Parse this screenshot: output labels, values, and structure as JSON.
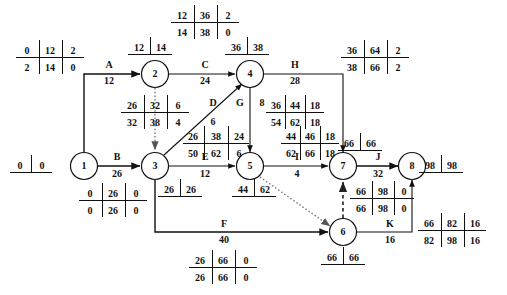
{
  "diagram": {
    "type": "pert-cpm-activity-on-arrow-network",
    "title": "",
    "nodes": [
      {
        "id": "1",
        "label": "1",
        "x": 84,
        "y": 166
      },
      {
        "id": "2",
        "label": "2",
        "x": 155,
        "y": 74
      },
      {
        "id": "3",
        "label": "3",
        "x": 155,
        "y": 166
      },
      {
        "id": "4",
        "label": "4",
        "x": 250,
        "y": 74
      },
      {
        "id": "5",
        "label": "5",
        "x": 250,
        "y": 166
      },
      {
        "id": "6",
        "label": "6",
        "x": 343,
        "y": 232
      },
      {
        "id": "7",
        "label": "7",
        "x": 343,
        "y": 166
      },
      {
        "id": "8",
        "label": "8",
        "x": 412,
        "y": 166
      }
    ],
    "activities": [
      {
        "id": "A",
        "letter": "A",
        "duration": "12",
        "from": "1",
        "to": "2",
        "letter_x": 109,
        "letter_y": 68,
        "dur_x": 109,
        "dur_y": 84
      },
      {
        "id": "B",
        "letter": "B",
        "duration": "26",
        "from": "1",
        "to": "3",
        "letter_x": 117,
        "letter_y": 160,
        "dur_x": 117,
        "dur_y": 176
      },
      {
        "id": "C",
        "letter": "C",
        "duration": "24",
        "from": "2",
        "to": "4",
        "letter_x": 205,
        "letter_y": 68,
        "dur_x": 205,
        "dur_y": 84
      },
      {
        "id": "D",
        "letter": "D",
        "duration": "6",
        "from": "3",
        "to": "4",
        "letter_x": 213,
        "letter_y": 105,
        "dur_x": 213,
        "dur_y": 121
      },
      {
        "id": "E",
        "letter": "E",
        "duration": "12",
        "from": "3",
        "to": "5",
        "letter_x": 205,
        "letter_y": 160,
        "dur_x": 205,
        "dur_y": 176
      },
      {
        "id": "F",
        "letter": "F",
        "duration": "40",
        "from": "3",
        "to": "6",
        "letter_x": 224,
        "letter_y": 226,
        "dur_x": 224,
        "dur_y": 242
      },
      {
        "id": "G",
        "letter": "G",
        "duration": "8",
        "from": "4",
        "to": "5",
        "letter_x": 243,
        "letter_y": 105,
        "dur_x": 258,
        "dur_y": 105
      },
      {
        "id": "H",
        "letter": "H",
        "duration": "28",
        "from": "4",
        "to": "7",
        "letter_x": 295,
        "letter_y": 68,
        "dur_x": 295,
        "dur_y": 84
      },
      {
        "id": "I",
        "letter": "I",
        "duration": "4",
        "from": "5",
        "to": "7",
        "letter_x": 297,
        "letter_y": 160,
        "dur_x": 297,
        "dur_y": 176
      },
      {
        "id": "J",
        "letter": "J",
        "duration": "32",
        "from": "7",
        "to": "8",
        "letter_x": 378,
        "letter_y": 160,
        "dur_x": 378,
        "dur_y": 176
      },
      {
        "id": "K",
        "letter": "K",
        "duration": "16",
        "from": "6",
        "to": "8",
        "letter_x": 390,
        "letter_y": 226,
        "dur_x": 390,
        "dur_y": 242
      }
    ],
    "dummy_links": [
      {
        "id": "dummy-2-3",
        "from": "2",
        "to": "3",
        "style": "dotted"
      },
      {
        "id": "dummy-5-6",
        "from": "5",
        "to": "6",
        "style": "dotted"
      },
      {
        "id": "dummy-6-7",
        "from": "6",
        "to": "7",
        "style": "dashed"
      }
    ],
    "node_time_boxes": [
      {
        "id": "node-1-times",
        "node": "1",
        "cells": [
          "0",
          "0"
        ],
        "cx": 31,
        "cy": 166
      },
      {
        "id": "node-2-times",
        "node": "2",
        "cells": [
          "12",
          "14"
        ],
        "cx": 149,
        "cy": 48
      },
      {
        "id": "node-3-times",
        "node": "3",
        "cells": [
          "26",
          "26"
        ],
        "cx": 179,
        "cy": 190
      },
      {
        "id": "node-4-times",
        "node": "4",
        "cells": [
          "36",
          "38"
        ],
        "cx": 246,
        "cy": 48
      },
      {
        "id": "node-5-times",
        "node": "5",
        "cells": [
          "44",
          "62"
        ],
        "cx": 253,
        "cy": 190
      },
      {
        "id": "node-6-times",
        "node": "6",
        "cells": [
          "66",
          "66"
        ],
        "cx": 342,
        "cy": 258
      },
      {
        "id": "node-7-times",
        "node": "7",
        "cells": [
          "66",
          "66"
        ],
        "cx": 359,
        "cy": 144
      },
      {
        "id": "node-8-times",
        "node": "8",
        "cells": [
          "98",
          "98"
        ],
        "cx": 440,
        "cy": 166
      }
    ],
    "activity_tables": [
      {
        "id": "table-A",
        "activity": "A",
        "top": [
          "0",
          "12",
          "2"
        ],
        "bottom": [
          "2",
          "14",
          "0"
        ],
        "cx": 50,
        "cy": 57
      },
      {
        "id": "table-C",
        "activity": "C",
        "top": [
          "12",
          "36",
          "2"
        ],
        "bottom": [
          "14",
          "38",
          "0"
        ],
        "cx": 205,
        "cy": 22
      },
      {
        "id": "table-H",
        "activity": "H",
        "top": [
          "36",
          "64",
          "2"
        ],
        "bottom": [
          "38",
          "66",
          "2"
        ],
        "cx": 375,
        "cy": 57
      },
      {
        "id": "table-dummy-2-3",
        "activity": "dummy 2-3",
        "top": [
          "26",
          "32",
          "6"
        ],
        "bottom": [
          "32",
          "38",
          "4"
        ],
        "cx": 155,
        "cy": 112
      },
      {
        "id": "table-G",
        "activity": "G",
        "top": [
          "36",
          "44",
          "18"
        ],
        "bottom": [
          "54",
          "62",
          "18"
        ],
        "cx": 295,
        "cy": 112
      },
      {
        "id": "table-D",
        "activity": "D",
        "top": [
          "26",
          "38",
          "24"
        ],
        "bottom": [
          "50",
          "62",
          "6"
        ],
        "cx": 206,
        "cy": 143
      },
      {
        "id": "table-I",
        "activity": "I",
        "top": [
          "44",
          "46",
          "18"
        ],
        "bottom": [
          "62",
          "66",
          "18"
        ],
        "cx": 310,
        "cy": 143
      },
      {
        "id": "table-B",
        "activity": "B",
        "top": [
          "0",
          "26",
          "0"
        ],
        "bottom": [
          "0",
          "26",
          "0"
        ],
        "cx": 113,
        "cy": 200
      },
      {
        "id": "table-J",
        "activity": "J",
        "top": [
          "66",
          "98",
          "0"
        ],
        "bottom": [
          "66",
          "98",
          "0"
        ],
        "cx": 382,
        "cy": 198
      },
      {
        "id": "table-K",
        "activity": "K",
        "top": [
          "66",
          "82",
          "16"
        ],
        "bottom": [
          "82",
          "98",
          "16"
        ],
        "cx": 450,
        "cy": 230
      },
      {
        "id": "table-F",
        "activity": "F",
        "top": [
          "26",
          "66",
          "0"
        ],
        "bottom": [
          "26",
          "66",
          "0"
        ],
        "cx": 223,
        "cy": 267
      }
    ],
    "extra_labels": [
      {
        "id": "g-slack",
        "text": "8",
        "x": 258,
        "y": 105
      }
    ],
    "colors": {
      "ink": "#111111",
      "dummy_dotted": "#777777",
      "dummy_dashed": "#222222",
      "background": "#ffffff"
    }
  }
}
